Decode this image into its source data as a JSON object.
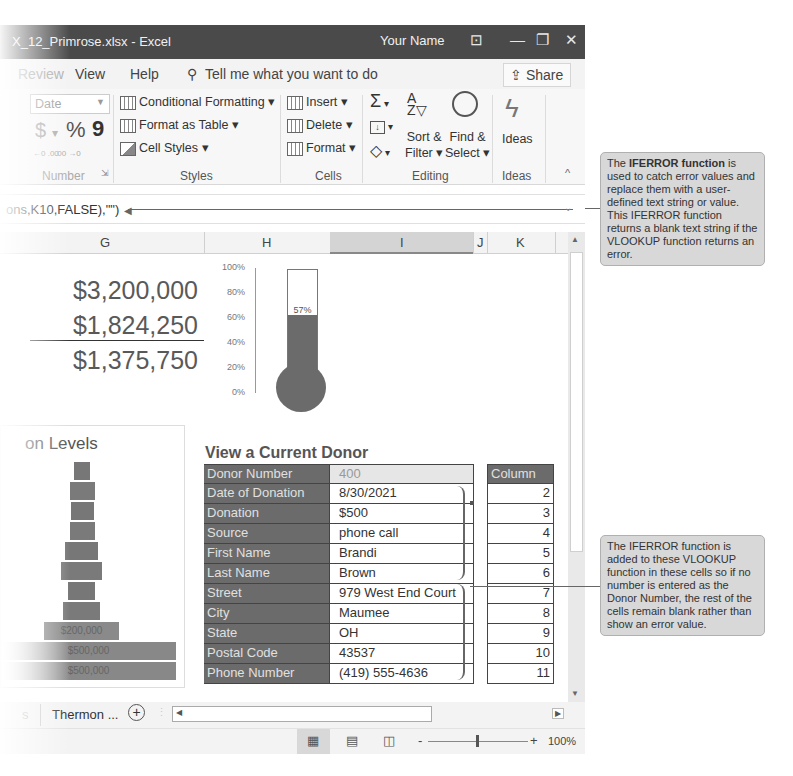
{
  "window": {
    "title": "X_12_Primrose.xlsx - Excel",
    "user": "Your Name",
    "controls": {
      "ribbon_display": "⊡",
      "minimize": "—",
      "restore": "❐",
      "close": "✕"
    }
  },
  "menu": {
    "items": [
      "Review",
      "View",
      "Help"
    ],
    "tell_me": "Tell me what you want to do",
    "share": "Share"
  },
  "ribbon": {
    "number": {
      "format_value": "Date",
      "currency": "$",
      "percent": "%",
      "comma": "9",
      "increase_decimal": "←0 .00",
      "decrease_decimal": ".00 →0",
      "label": "Number"
    },
    "styles": {
      "conditional_formatting": "Conditional Formatting",
      "format_as_table": "Format as Table",
      "cell_styles": "Cell Styles",
      "label": "Styles"
    },
    "cells": {
      "insert": "Insert",
      "delete": "Delete",
      "format": "Format",
      "label": "Cells"
    },
    "editing": {
      "autosum": "Σ",
      "sort_filter_1": "Sort &",
      "sort_filter_2": "Filter",
      "find_select_1": "Find &",
      "find_select_2": "Select",
      "label": "Editing"
    },
    "ideas": {
      "button": "Ideas",
      "label": "Ideas"
    }
  },
  "formula_bar": {
    "value": "ons,K10,FALSE),\"\")"
  },
  "columns": [
    "G",
    "H",
    "I",
    "J",
    "K"
  ],
  "summary": {
    "goal": "$3,200,000",
    "raised": "$1,824,250",
    "remaining": "$1,375,750"
  },
  "thermometer": {
    "axis_ticks": [
      "100%",
      "80%",
      "60%",
      "40%",
      "20%",
      "0%"
    ],
    "value_label": "57%",
    "value": 57
  },
  "levels_chart": {
    "title": "on Levels",
    "bar_labels": [
      "$200,000",
      "$500,000",
      "$500,000"
    ]
  },
  "donor": {
    "title": "View a Current Donor",
    "rows": [
      {
        "label": "Donor Number",
        "value": "400"
      },
      {
        "label": "Date of Donation",
        "value": "8/30/2021"
      },
      {
        "label": "Donation",
        "value": "$500"
      },
      {
        "label": "Source",
        "value": "phone call"
      },
      {
        "label": "First Name",
        "value": "Brandi"
      },
      {
        "label": "Last Name",
        "value": "Brown"
      },
      {
        "label": "Street",
        "value": "979 West End Court"
      },
      {
        "label": "City",
        "value": "Maumee"
      },
      {
        "label": "State",
        "value": "OH"
      },
      {
        "label": "Postal Code",
        "value": "43537"
      },
      {
        "label": "Phone Number",
        "value": "(419) 555-4636"
      }
    ],
    "column_header": "Column",
    "column_values": [
      "2",
      "3",
      "4",
      "5",
      "6",
      "7",
      "8",
      "9",
      "10",
      "11"
    ]
  },
  "callouts": {
    "top_bold": "IFERROR function",
    "top_pre": "The ",
    "top_post": " is used to catch error values and replace them with a user-defined text string or value. This IFERROR function returns a blank text string if the VLOOKUP function returns an error.",
    "bottom": "The IFERROR function is added to these VLOOKUP function in these cells so if no number is entered as the Donor Number, the rest of the cells remain blank rather than show an error value."
  },
  "sheet_tabs": {
    "partial": "s",
    "active": "Thermon ...",
    "add": "+"
  },
  "status": {
    "zoom": "100%"
  },
  "colors": {
    "titlebar": "#4a4a4a",
    "label_cell": "#6b6b6b",
    "thermo_fill": "#6b6b6b",
    "callout_bg": "#d8d8d8"
  }
}
